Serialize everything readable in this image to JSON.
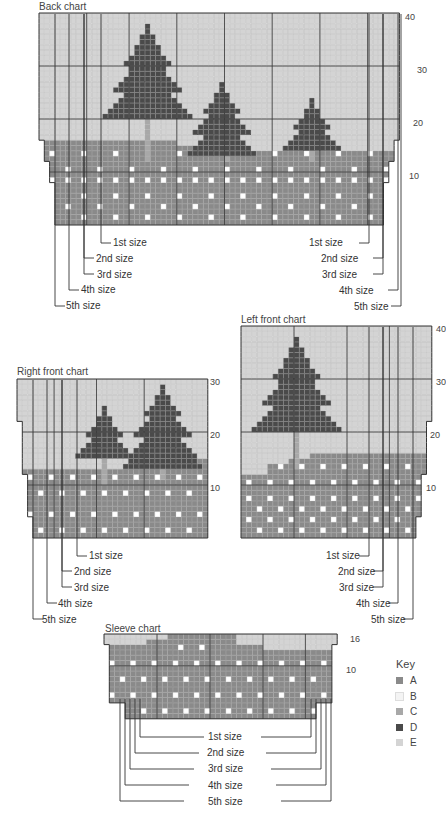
{
  "colors": {
    "A": "#8a8a8a",
    "B": "#f4f4f4",
    "C": "#a8a8a8",
    "D": "#4a4a4a",
    "E": "#d4d4d4",
    "grid_fine": "#b0b0b0",
    "grid_major": "#333333",
    "outline": "#333333"
  },
  "charts": {
    "back": {
      "title": "Back chart",
      "row_labels": [
        "40",
        "30",
        "20",
        "10"
      ],
      "size_labels_left": [
        "1st size",
        "2nd size",
        "3rd size",
        "4th size",
        "5th size"
      ],
      "size_labels_right": [
        "1st size",
        "2nd size",
        "3rd size",
        "4th size",
        "5th size"
      ]
    },
    "right_front": {
      "title": "Right front chart",
      "row_labels": [
        "30",
        "20",
        "10"
      ],
      "size_labels": [
        "1st size",
        "2nd size",
        "3rd size",
        "4th size",
        "5th size"
      ]
    },
    "left_front": {
      "title": "Left front chart",
      "row_labels": [
        "40",
        "30",
        "20",
        "10"
      ],
      "size_labels": [
        "1st size",
        "2nd size",
        "3rd size",
        "4th size",
        "5th size"
      ]
    },
    "sleeve": {
      "title": "Sleeve chart",
      "row_labels": [
        "16",
        "10"
      ],
      "size_labels": [
        "1st size",
        "2nd size",
        "3rd size",
        "4th size",
        "5th size"
      ]
    }
  },
  "key": {
    "title": "Key",
    "items": [
      {
        "label": "A",
        "color": "#8a8a8a"
      },
      {
        "label": "B",
        "color": "#f4f4f4"
      },
      {
        "label": "C",
        "color": "#a8a8a8"
      },
      {
        "label": "D",
        "color": "#4a4a4a"
      },
      {
        "label": "E",
        "color": "#d4d4d4"
      }
    ]
  }
}
